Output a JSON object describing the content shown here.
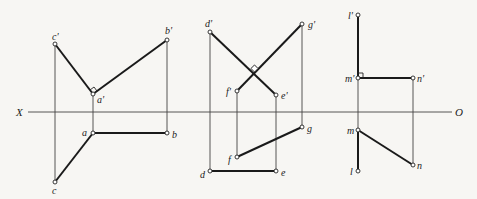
{
  "axis": {
    "left_label": "X",
    "right_label": "O",
    "y": 112,
    "x_start": 28,
    "x_end": 452
  },
  "figures": [
    {
      "name": "figure-1",
      "points": {
        "c_prime": {
          "label": "c'",
          "x": 55,
          "y": 44
        },
        "a_prime": {
          "label": "a'",
          "x": 93,
          "y": 94
        },
        "b_prime": {
          "label": "b'",
          "x": 167,
          "y": 40
        },
        "c": {
          "label": "c",
          "x": 55,
          "y": 182
        },
        "a": {
          "label": "a",
          "x": 93,
          "y": 133
        },
        "b": {
          "label": "b",
          "x": 167,
          "y": 133
        }
      },
      "right_angle_at": "a'"
    },
    {
      "name": "figure-2",
      "points": {
        "d_prime": {
          "label": "d'",
          "x": 210,
          "y": 32
        },
        "e_prime": {
          "label": "e'",
          "x": 276,
          "y": 95
        },
        "f_prime": {
          "label": "f'",
          "x": 237,
          "y": 91
        },
        "g_prime": {
          "label": "g'",
          "x": 302,
          "y": 24
        },
        "d": {
          "label": "d",
          "x": 210,
          "y": 171
        },
        "e": {
          "label": "e",
          "x": 276,
          "y": 171
        },
        "f": {
          "label": "f",
          "x": 237,
          "y": 157
        },
        "g": {
          "label": "g",
          "x": 302,
          "y": 127
        }
      },
      "right_angle_at": "intersection of d'e' and f'g'"
    },
    {
      "name": "figure-3",
      "points": {
        "l_prime": {
          "label": "l'",
          "x": 358,
          "y": 15
        },
        "m_prime": {
          "label": "m'",
          "x": 358,
          "y": 78
        },
        "n_prime": {
          "label": "n'",
          "x": 413,
          "y": 78
        },
        "m": {
          "label": "m",
          "x": 358,
          "y": 130
        },
        "l": {
          "label": "l",
          "x": 358,
          "y": 171
        },
        "n": {
          "label": "n",
          "x": 413,
          "y": 165
        }
      },
      "right_angle_at": "m'"
    }
  ]
}
